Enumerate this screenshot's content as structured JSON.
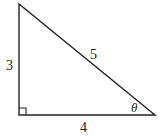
{
  "diagram": {
    "type": "right-triangle",
    "vertices": {
      "top": [
        19,
        4
      ],
      "right_angle": [
        19,
        115
      ],
      "acute": [
        155,
        115
      ]
    },
    "sides": {
      "vertical_leg": "3",
      "horizontal_leg": "4",
      "hypotenuse": "5"
    },
    "angle_label": "θ",
    "right_angle_marker": true,
    "stroke_color": "#222222"
  }
}
